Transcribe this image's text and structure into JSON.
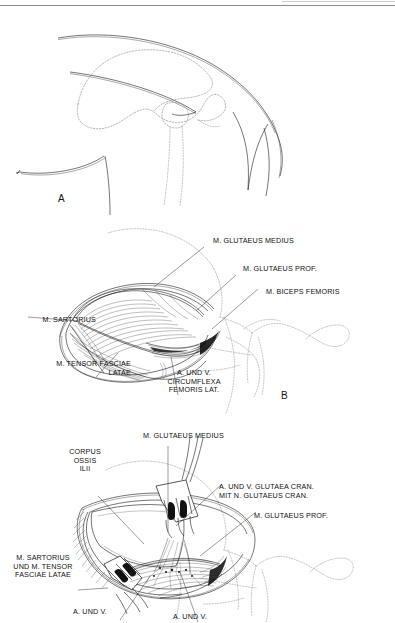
{
  "document": {
    "type": "veterinary-anatomy-plate",
    "description": "Surgical approach to the canine ilium / hip — three-stage dissection plate",
    "language": "de",
    "background_color": "#ffffff",
    "ink_color": "#1a1a1a",
    "dashed_color": "#7a7a7a"
  },
  "panels": [
    {
      "id": "A",
      "letter": "A",
      "caption": "",
      "labels": []
    },
    {
      "id": "B",
      "letter": "B",
      "labels": [
        {
          "id": "b-glut-medius",
          "text": "M. GLUTAEUS MEDIUS"
        },
        {
          "id": "b-glut-prof",
          "text": "M. GLUTAEUS PROF."
        },
        {
          "id": "b-biceps",
          "text": "M. BICEPS FEMORIS"
        },
        {
          "id": "b-sartorius",
          "text": "M. SARTORIUS"
        },
        {
          "id": "b-tensor",
          "text": "M. TENSOR FASCIAE\nLATAE"
        },
        {
          "id": "b-circumflexa",
          "text": "A. UND V.\nCIRCUMFLEXA\nFEMORIS LAT."
        }
      ]
    },
    {
      "id": "C",
      "letter": "C",
      "labels": [
        {
          "id": "c-glut-medius",
          "text": "M. GLUTAEUS MEDIUS"
        },
        {
          "id": "c-corpus",
          "text": "CORPUS\nOSSIS\nILII"
        },
        {
          "id": "c-glutaea-cran",
          "text": "A. UND V. GLUTAEA CRAN.\nMIT N. GLUTAEUS CRAN."
        },
        {
          "id": "c-glut-prof",
          "text": "M. GLUTAEUS PROF."
        },
        {
          "id": "c-sartorius",
          "text": "M. SARTORIUS\nUND M. TENSOR\nFASCIAE LATAE"
        },
        {
          "id": "c-aundv-left",
          "text": "A. UND V."
        },
        {
          "id": "c-aundv-right",
          "text": "A. UND V."
        }
      ]
    }
  ]
}
